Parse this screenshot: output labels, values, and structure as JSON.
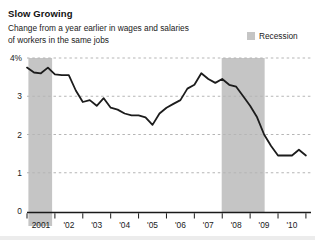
{
  "header": {
    "title": "Slow Growing",
    "subtitle_line1": "Change from a year earlier in wages and salaries",
    "subtitle_line2": "of workers in the same jobs"
  },
  "legend": {
    "label": "Recession",
    "swatch_color": "#c5c5c5"
  },
  "chart_data": {
    "type": "line",
    "title": "Slow Growing",
    "subtitle": "Change from a year earlier in wages and salaries of workers in the same jobs",
    "series": [
      {
        "name": "Wage and salary growth, % change from a year earlier",
        "x": [
          2001.0,
          2001.25,
          2001.5,
          2001.75,
          2002.0,
          2002.25,
          2002.5,
          2002.75,
          2003.0,
          2003.25,
          2003.5,
          2003.75,
          2004.0,
          2004.25,
          2004.5,
          2004.75,
          2005.0,
          2005.25,
          2005.5,
          2005.75,
          2006.0,
          2006.25,
          2006.5,
          2006.75,
          2007.0,
          2007.25,
          2007.5,
          2007.75,
          2008.0,
          2008.25,
          2008.5,
          2008.75,
          2009.0,
          2009.25,
          2009.5,
          2009.75,
          2010.0,
          2010.25,
          2010.5,
          2010.75,
          2011.0
        ],
        "values": [
          3.75,
          3.62,
          3.6,
          3.75,
          3.57,
          3.55,
          3.55,
          3.15,
          2.85,
          2.9,
          2.75,
          2.95,
          2.7,
          2.65,
          2.55,
          2.5,
          2.5,
          2.45,
          2.25,
          2.55,
          2.7,
          2.8,
          2.9,
          3.2,
          3.3,
          3.6,
          3.45,
          3.35,
          3.45,
          3.3,
          3.25,
          3.0,
          2.75,
          2.45,
          2.0,
          1.7,
          1.45,
          1.45,
          1.45,
          1.6,
          1.45
        ]
      }
    ],
    "xlabel": "",
    "ylabel": "",
    "xlim": [
      2001.0,
      2011.2
    ],
    "ylim": [
      0,
      4
    ],
    "y_ticks": [
      {
        "value": 4,
        "label": "4%"
      },
      {
        "value": 3,
        "label": "3"
      },
      {
        "value": 2,
        "label": "2"
      },
      {
        "value": 1,
        "label": "1"
      },
      {
        "value": 0,
        "label": "0"
      }
    ],
    "x_tick_years": [
      2001,
      2002,
      2003,
      2004,
      2005,
      2006,
      2007,
      2008,
      2009,
      2010,
      2011
    ],
    "x_tick_labels": [
      {
        "center": 2001.5,
        "label": "2001"
      },
      {
        "center": 2002.5,
        "label": "'02"
      },
      {
        "center": 2003.5,
        "label": "'03"
      },
      {
        "center": 2004.5,
        "label": "'04"
      },
      {
        "center": 2005.5,
        "label": "'05"
      },
      {
        "center": 2006.5,
        "label": "'06"
      },
      {
        "center": 2007.5,
        "label": "'07"
      },
      {
        "center": 2008.5,
        "label": "'08"
      },
      {
        "center": 2009.5,
        "label": "'09"
      },
      {
        "center": 2010.5,
        "label": "'10"
      }
    ],
    "grid": "horizontal-dashed",
    "legend_position": "top-right",
    "legend_entries": [
      {
        "label": "Recession",
        "type": "shaded-band"
      }
    ],
    "recession_bands": [
      {
        "start": 2001.05,
        "end": 2001.9
      },
      {
        "start": 2007.98,
        "end": 2009.52
      }
    ],
    "colors": {
      "line": "#1c1c1c",
      "recession_band": "#c5c5c5",
      "gridline": "#b5b5b5",
      "axis": "#1a1a1a",
      "tick_text": "#1a1a1a"
    }
  }
}
